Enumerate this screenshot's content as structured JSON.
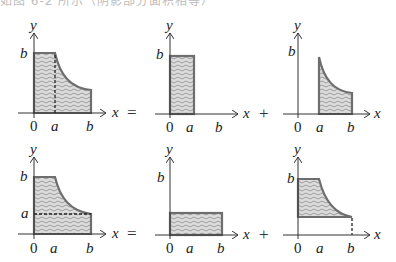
{
  "header_clip": {
    "text": "如图 6-2 所示（阴影部分面积相等）"
  },
  "labels": {
    "x": "x",
    "y": "y",
    "zero": "0",
    "a": "a",
    "b": "b"
  },
  "operators": {
    "equals": "=",
    "plus": "+"
  },
  "colors": {
    "outline": "#6e6e6e",
    "fill": "#d6d6d6",
    "wave": "#8a8a8a",
    "axis": "#333333",
    "dash": "#222222"
  },
  "rows": [
    {
      "name": "top-row",
      "description": "Region split by vertical dashed line at x=a",
      "panels": [
        {
          "name": "whole-region",
          "shape": "rect 0..a height b + curve from a to b",
          "dashed": "vertical at a"
        },
        {
          "name": "rectangle-0-a",
          "shape": "rect 0..a height b"
        },
        {
          "name": "curve-region-a-b",
          "shape": "area under curve from a to b"
        }
      ]
    },
    {
      "name": "bottom-row",
      "description": "Region split by horizontal dashed line at y=a",
      "panels": [
        {
          "name": "whole-region",
          "shape": "rect 0..a height b + curve from a to b",
          "dashed": "horizontal at a"
        },
        {
          "name": "rectangle-0-b",
          "shape": "rect 0..b height a"
        },
        {
          "name": "region-above-a",
          "shape": "area between curve and y=a"
        }
      ]
    }
  ]
}
